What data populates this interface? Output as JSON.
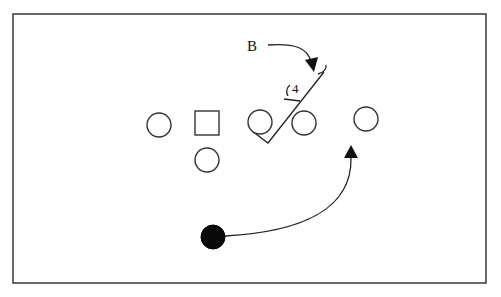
{
  "diagram": {
    "labels": {
      "defender": "B",
      "gap_number": "4"
    },
    "frame": {
      "x": 13,
      "y": 14,
      "width": 473,
      "height": 269
    },
    "players": [
      {
        "id": "circle-left",
        "shape": "circle",
        "cx": 159,
        "cy": 125,
        "r": 12
      },
      {
        "id": "square-center",
        "shape": "square",
        "x": 195,
        "y": 111,
        "size": 24
      },
      {
        "id": "circle-behind-center",
        "shape": "circle",
        "cx": 207,
        "cy": 160,
        "r": 12
      },
      {
        "id": "circle-guard",
        "shape": "circle",
        "cx": 260,
        "cy": 122,
        "r": 12
      },
      {
        "id": "circle-tackle",
        "shape": "circle",
        "cx": 304,
        "cy": 123,
        "r": 12
      },
      {
        "id": "circle-end",
        "shape": "circle",
        "cx": 366,
        "cy": 119,
        "r": 12
      },
      {
        "id": "ball-carrier",
        "shape": "filled-circle",
        "cx": 213,
        "cy": 237,
        "r": 12
      }
    ],
    "colors": {
      "stroke": "#333333",
      "fill_ball_carrier": "#0a0a0a",
      "background": "#ffffff"
    }
  }
}
